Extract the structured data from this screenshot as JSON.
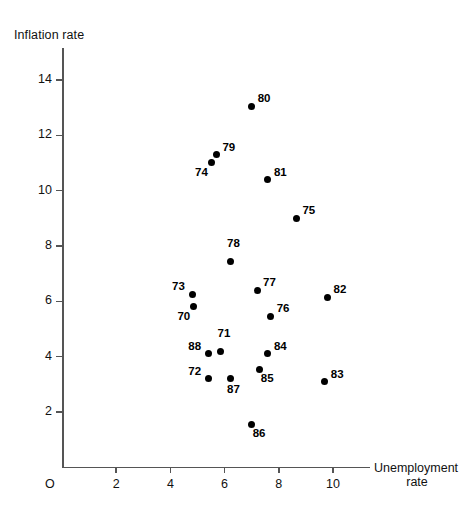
{
  "chart_data": {
    "type": "scatter",
    "title": "",
    "xlabel": "Unemployment rate",
    "ylabel": "Inflation rate",
    "origin_label": "O",
    "xlim": [
      0,
      11.4
    ],
    "ylim": [
      0,
      15.1
    ],
    "xticks": [
      2,
      4,
      6,
      8,
      10
    ],
    "yticks": [
      2,
      4,
      6,
      8,
      10,
      12,
      14
    ],
    "grid": false,
    "legend": "none",
    "point_label_meaning": "two-digit year",
    "points": [
      {
        "label": "70",
        "x": 4.85,
        "y": 5.8,
        "label_pos": "below-left"
      },
      {
        "label": "71",
        "x": 5.85,
        "y": 4.2,
        "label_pos": "above"
      },
      {
        "label": "72",
        "x": 5.4,
        "y": 3.2,
        "label_pos": "left"
      },
      {
        "label": "73",
        "x": 4.8,
        "y": 6.25,
        "label_pos": "left"
      },
      {
        "label": "74",
        "x": 5.5,
        "y": 11.0,
        "label_pos": "below-left"
      },
      {
        "label": "75",
        "x": 8.65,
        "y": 9.0,
        "label_pos": "right"
      },
      {
        "label": "76",
        "x": 7.7,
        "y": 5.45,
        "label_pos": "right"
      },
      {
        "label": "77",
        "x": 7.2,
        "y": 6.4,
        "label_pos": "right"
      },
      {
        "label": "78",
        "x": 6.2,
        "y": 7.45,
        "label_pos": "above"
      },
      {
        "label": "79",
        "x": 5.7,
        "y": 11.3,
        "label_pos": "right"
      },
      {
        "label": "80",
        "x": 7.0,
        "y": 13.05,
        "label_pos": "right"
      },
      {
        "label": "81",
        "x": 7.6,
        "y": 10.4,
        "label_pos": "right"
      },
      {
        "label": "82",
        "x": 9.8,
        "y": 6.15,
        "label_pos": "right"
      },
      {
        "label": "83",
        "x": 9.7,
        "y": 3.1,
        "label_pos": "right"
      },
      {
        "label": "84",
        "x": 7.6,
        "y": 4.1,
        "label_pos": "right"
      },
      {
        "label": "85",
        "x": 7.3,
        "y": 3.55,
        "label_pos": "below-right"
      },
      {
        "label": "86",
        "x": 7.0,
        "y": 1.55,
        "label_pos": "below-right"
      },
      {
        "label": "87",
        "x": 6.2,
        "y": 3.2,
        "label_pos": "below"
      },
      {
        "label": "88",
        "x": 5.4,
        "y": 4.1,
        "label_pos": "left"
      }
    ],
    "colors": {
      "point": "#000000",
      "axis": "#555555",
      "text": "#111111",
      "background": "#ffffff"
    }
  }
}
